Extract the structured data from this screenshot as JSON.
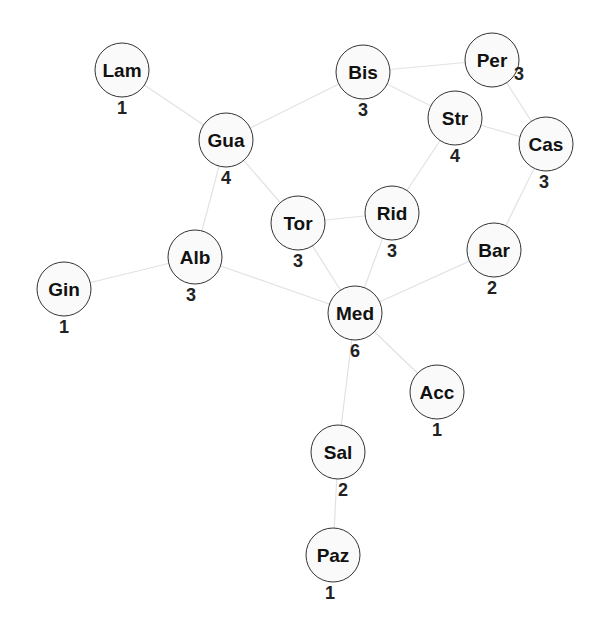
{
  "diagram": {
    "type": "network-graph",
    "node_radius": 27,
    "colors": {
      "edge": "#e2e2e2",
      "node_fill": "#fafafa",
      "node_stroke": "#333333",
      "text": "#111111"
    },
    "nodes": [
      {
        "id": "Lam",
        "label": "Lam",
        "degree": "1",
        "x": 122,
        "y": 70,
        "dx": 0,
        "dy": 38
      },
      {
        "id": "Gua",
        "label": "Gua",
        "degree": "4",
        "x": 226,
        "y": 140,
        "dx": 0,
        "dy": 38
      },
      {
        "id": "Bis",
        "label": "Bis",
        "degree": "3",
        "x": 363,
        "y": 72,
        "dx": 0,
        "dy": 38
      },
      {
        "id": "Per",
        "label": "Per",
        "degree": "3",
        "x": 492,
        "y": 60,
        "dx": 27,
        "dy": 14
      },
      {
        "id": "Str",
        "label": "Str",
        "degree": "4",
        "x": 455,
        "y": 118,
        "dx": 0,
        "dy": 38
      },
      {
        "id": "Cas",
        "label": "Cas",
        "degree": "3",
        "x": 546,
        "y": 144,
        "dx": -2,
        "dy": 38
      },
      {
        "id": "Tor",
        "label": "Tor",
        "degree": "3",
        "x": 298,
        "y": 223,
        "dx": 0,
        "dy": 38
      },
      {
        "id": "Rid",
        "label": "Rid",
        "degree": "3",
        "x": 392,
        "y": 213,
        "dx": 0,
        "dy": 38
      },
      {
        "id": "Alb",
        "label": "Alb",
        "degree": "3",
        "x": 195,
        "y": 257,
        "dx": -4,
        "dy": 38
      },
      {
        "id": "Bar",
        "label": "Bar",
        "degree": "2",
        "x": 494,
        "y": 250,
        "dx": -2,
        "dy": 38
      },
      {
        "id": "Gin",
        "label": "Gin",
        "degree": "1",
        "x": 64,
        "y": 289,
        "dx": 0,
        "dy": 38
      },
      {
        "id": "Med",
        "label": "Med",
        "degree": "6",
        "x": 355,
        "y": 313,
        "dx": 0,
        "dy": 38
      },
      {
        "id": "Acc",
        "label": "Acc",
        "degree": "1",
        "x": 437,
        "y": 392,
        "dx": 0,
        "dy": 38
      },
      {
        "id": "Sal",
        "label": "Sal",
        "degree": "2",
        "x": 338,
        "y": 452,
        "dx": 5,
        "dy": 38
      },
      {
        "id": "Paz",
        "label": "Paz",
        "degree": "1",
        "x": 333,
        "y": 555,
        "dx": -3,
        "dy": 38
      }
    ],
    "edges": [
      [
        "Lam",
        "Gua"
      ],
      [
        "Gua",
        "Bis"
      ],
      [
        "Gua",
        "Tor"
      ],
      [
        "Gua",
        "Alb"
      ],
      [
        "Bis",
        "Per"
      ],
      [
        "Bis",
        "Str"
      ],
      [
        "Per",
        "Cas"
      ],
      [
        "Str",
        "Cas"
      ],
      [
        "Str",
        "Rid"
      ],
      [
        "Cas",
        "Bar"
      ],
      [
        "Tor",
        "Rid"
      ],
      [
        "Tor",
        "Med"
      ],
      [
        "Rid",
        "Med"
      ],
      [
        "Alb",
        "Gin"
      ],
      [
        "Alb",
        "Med"
      ],
      [
        "Bar",
        "Med"
      ],
      [
        "Med",
        "Acc"
      ],
      [
        "Med",
        "Sal"
      ],
      [
        "Sal",
        "Paz"
      ]
    ]
  }
}
